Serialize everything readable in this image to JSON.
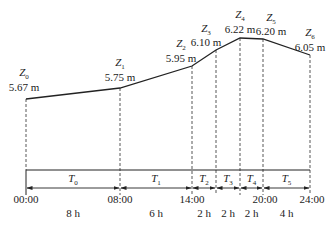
{
  "diagram": {
    "points": [
      {
        "name": "Z",
        "sub": "0",
        "value": "5.67 m",
        "x": 26,
        "y": 99,
        "lx": 24,
        "ly1": 76,
        "ly2": 91
      },
      {
        "name": "Z",
        "sub": "1",
        "value": "5.75 m",
        "x": 120,
        "y": 88,
        "lx": 120,
        "ly1": 66,
        "ly2": 81
      },
      {
        "name": "Z",
        "sub": "2",
        "value": "5.95 m",
        "x": 192,
        "y": 66,
        "lx": 181,
        "ly1": 47,
        "ly2": 62
      },
      {
        "name": "Z",
        "sub": "3",
        "value": "6.10 m",
        "x": 216,
        "y": 50,
        "lx": 206,
        "ly1": 32,
        "ly2": 46
      },
      {
        "name": "Z",
        "sub": "4",
        "value": "6.22 m",
        "x": 240,
        "y": 38,
        "lx": 240,
        "ly1": 18,
        "ly2": 33
      },
      {
        "name": "Z",
        "sub": "5",
        "value": "6.20 m",
        "x": 263,
        "y": 39,
        "lx": 271,
        "ly1": 21,
        "ly2": 35
      },
      {
        "name": "Z",
        "sub": "6",
        "value": "6.05 m",
        "x": 310,
        "y": 55,
        "lx": 310,
        "ly1": 36,
        "ly2": 51
      }
    ],
    "periods": [
      {
        "name": "T",
        "sub": "0",
        "x1": 26,
        "x2": 120,
        "duration": "8 h"
      },
      {
        "name": "T",
        "sub": "1",
        "x1": 120,
        "x2": 192,
        "duration": "6 h"
      },
      {
        "name": "T",
        "sub": "2",
        "x1": 192,
        "x2": 216,
        "duration": "2 h"
      },
      {
        "name": "T",
        "sub": "3",
        "x1": 216,
        "x2": 240,
        "duration": "2 h"
      },
      {
        "name": "T",
        "sub": "4",
        "x1": 240,
        "x2": 263,
        "duration": "2 h"
      },
      {
        "name": "T",
        "sub": "5",
        "x1": 263,
        "x2": 310,
        "duration": "4 h"
      }
    ],
    "times": [
      {
        "label": "00:00",
        "x": 26
      },
      {
        "label": "08:00",
        "x": 120
      },
      {
        "label": "14:00",
        "x": 192
      },
      {
        "label": "20:00",
        "x": 265
      },
      {
        "label": "24:00",
        "x": 312
      }
    ],
    "line_color": "#222222"
  }
}
